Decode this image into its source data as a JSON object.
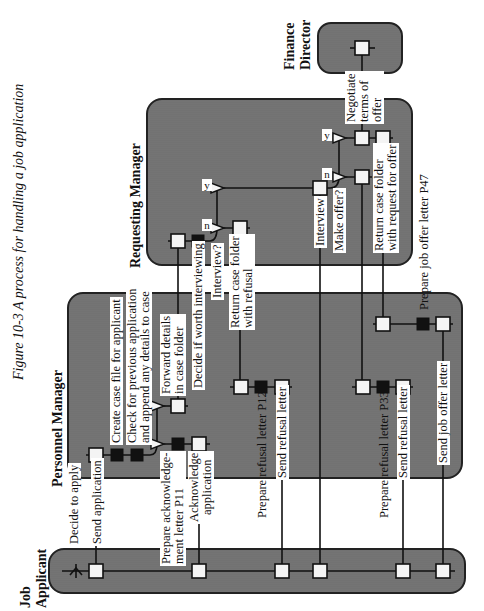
{
  "caption": "Figure 10-3  A process for handling a job application",
  "lanes": {
    "applicant": "Job Applicant",
    "personnel": "Personnel Manager",
    "requesting": "Requesting Manager",
    "finance": "Finance Director"
  },
  "labels": {
    "decide_apply": "Decide to apply",
    "send_application": "Send application",
    "create_case": "Create case file for applicant",
    "check_previous_1": "Check for previous application",
    "check_previous_2": "and append any details to case",
    "forward_1": "Forward details",
    "forward_2": "in case folder",
    "decide_worth": "Decide if worth interviewing",
    "prepare_ack_1": "Prepare acknowledge-",
    "prepare_ack_2": "ment letter P11",
    "ack_1": "Acknowledge",
    "ack_2": "application",
    "interview_q": "Interview?",
    "return_refusal_1": "Return case folder",
    "return_refusal_2": "with refusal",
    "prepare_refusal_p12": "Prepare refusal letter P12",
    "send_refusal_1": "Send refusal letter",
    "interview": "Interview",
    "make_offer_q": "Make offer?",
    "prepare_refusal_p33": "Prepare refusal letter P33",
    "send_refusal_2": "Send refusal letter",
    "return_offer_1": "Return case folder",
    "return_offer_2": "with request for offer",
    "negotiate_1": "Negotiate",
    "negotiate_2": "terms of",
    "negotiate_3": "offer",
    "prepare_offer": "Prepare job offer letter P47",
    "send_offer": "Send job offer letter",
    "yes": "y",
    "no": "n"
  },
  "colors": {
    "lane_fill": "#707070",
    "lane_border": "#222222",
    "node_fill": "#f4f4f4",
    "black_node": "#111111"
  }
}
